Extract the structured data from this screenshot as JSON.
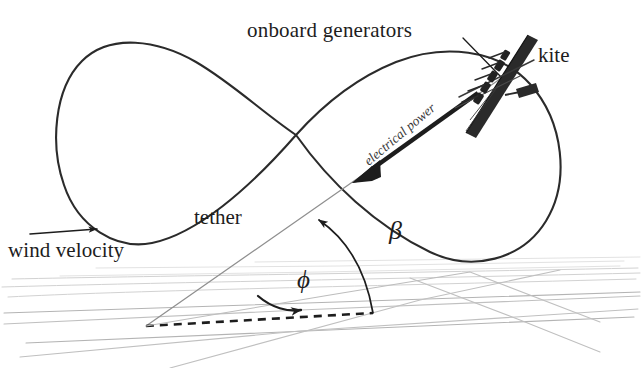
{
  "figure": {
    "background_color": "#ffffff",
    "width": 642,
    "height": 368
  },
  "labels": {
    "onboard_generators": "onboard generators",
    "kite": "kite",
    "electrical_power": "electrical power",
    "tether": "tether",
    "wind_velocity": "wind velocity",
    "beta": "β",
    "phi": "ϕ"
  },
  "colors": {
    "ink": "#1d1d1d",
    "path_stroke": "#2b2b2b",
    "tether_stroke": "#8a8a8a",
    "ground_grid": "#cfcfcf",
    "ground_grid_strong": "#a8a8a8",
    "dashed_projection": "#1d1d1d",
    "kite_body": "#2a2a2a",
    "arrow_fill": "#1d1d1d",
    "italic_label": "#3a3a3a"
  },
  "elements": {
    "flight_path": {
      "name": "figure-eight flight path",
      "description": "Closed lazy-eight (figure-of-eight) crosswind trajectory drawn in perspective; large left lobe and tilted right lobe crossing near image centre."
    },
    "kite": {
      "name": "kite",
      "description": "Dark slender rigid wing inclined from lower-left to upper-right, carrying a row of small onboard generator pods, with a small winglet / tail surface to its right."
    },
    "onboard_generators": {
      "name": "onboard generators",
      "description": "Row of small dark propeller/turbine pods mounted along the kite wing; annotated by a leader line from the text label."
    },
    "electrical_power": {
      "name": "electrical power arrow",
      "description": "Thick solid arrow pointing down-left along the tether from the kite toward the ground station, labelled in italics."
    },
    "tether": {
      "name": "tether",
      "description": "Thin straight grey line from the ground anchor point up-right to the kite."
    },
    "wind_velocity": {
      "name": "wind velocity arrow",
      "description": "Thin horizontal arrow at the left pointing right, indicating the incoming wind direction."
    },
    "beta": {
      "name": "elevation angle beta",
      "description": "Curved arc with an arrowhead measuring the elevation angle between the ground plane projection and the tether."
    },
    "phi": {
      "name": "azimuth angle phi",
      "description": "Curved arc with an arrowhead in the ground plane measuring the azimuth angle between the downwind direction and the tether's ground projection."
    },
    "ground_plane": {
      "name": "ground plane",
      "description": "Faint grey perspective grid of lines representing the horizontal ground plane."
    },
    "projection": {
      "name": "tether ground projection",
      "description": "Bold black dashed line in the ground plane from the anchor point to the foot of the beta arc."
    },
    "anchor": {
      "name": "ground station anchor point",
      "description": "Point where the tether, the dashed ground projection and the azimuth reference line all meet."
    }
  },
  "geometry": {
    "anchor_point": [
      146,
      326
    ],
    "kite_point": [
      498,
      80
    ],
    "path_crossing": [
      296,
      135
    ],
    "beta_foot": [
      373,
      313
    ],
    "wind_arrow": {
      "from": [
        30,
        233
      ],
      "to": [
        101,
        228
      ]
    },
    "power_arrow": {
      "from": [
        476,
        95
      ],
      "to": [
        355,
        182
      ]
    }
  }
}
